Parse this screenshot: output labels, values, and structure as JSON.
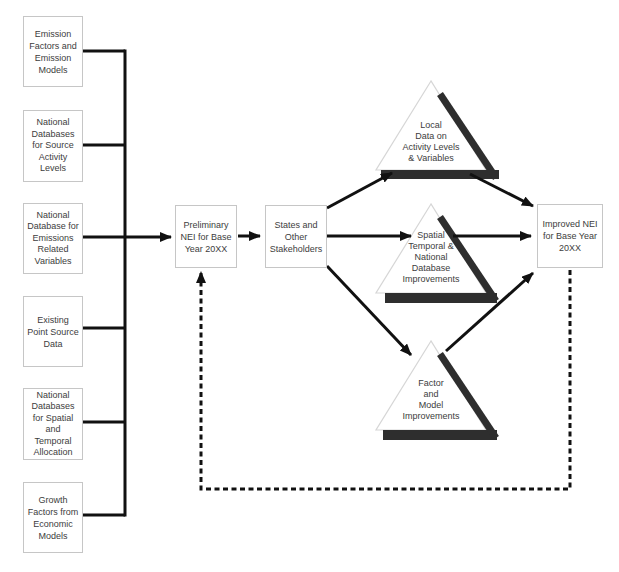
{
  "diagram": {
    "left_boxes": [
      {
        "label": "Emission\nFactors and\nEmission\nModels"
      },
      {
        "label": "National\nDatabases\nfor Source\nActivity\nLevels"
      },
      {
        "label": "National\nDatabase for\nEmissions\nRelated\nVariables"
      },
      {
        "label": "Existing\nPoint Source\nData"
      },
      {
        "label": "National\nDatabases\nfor Spatial\nand\nTemporal\nAllocation"
      },
      {
        "label": "Growth\nFactors from\nEconomic\nModels"
      }
    ],
    "flow_boxes": {
      "preliminary": {
        "label": "Preliminary\nNEI for Base\nYear 20XX"
      },
      "states": {
        "label": "States and\nOther\nStakeholders"
      },
      "improved": {
        "label": "Improved NEI\nfor Base Year\n20XX"
      }
    },
    "triangles": [
      {
        "label": "Local\nData on\nActivity Levels\n& Variables"
      },
      {
        "label": "Spatial\nTemporal &\nNational\nDatabase\nImprovements"
      },
      {
        "label": "Factor\nand\nModel\nImprovements"
      }
    ],
    "colors": {
      "line": "#111111",
      "box_border": "#c6c6c6",
      "triangle_outline": "#d6d6d6",
      "triangle_shadow": "#2e2e2e",
      "text": "#3d3d3d",
      "background": "#ffffff"
    }
  }
}
